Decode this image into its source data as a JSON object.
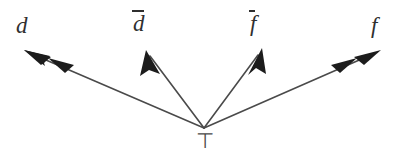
{
  "figure": {
    "type": "arrow-diagram",
    "background_color": "#ffffff",
    "line_color": "#4a4a4a",
    "arrowhead_color": "#1c1c1c",
    "label_color": "#2f2f2f"
  },
  "origin": {
    "label": "⊤",
    "label_name": "top-symbol",
    "x": 204,
    "y": 128
  },
  "arrows": [
    {
      "id": "arrow-d",
      "label": "d",
      "has_overline": false,
      "arrowheads": 2,
      "label_x": 16,
      "label_y": 14,
      "from_x": 204,
      "from_y": 128,
      "to_x": 24,
      "to_y": 50
    },
    {
      "id": "arrow-dbar",
      "label": "d",
      "has_overline": true,
      "arrowheads": 1,
      "label_x": 133,
      "label_y": 10,
      "from_x": 204,
      "from_y": 128,
      "to_x": 146,
      "to_y": 50
    },
    {
      "id": "arrow-fbar",
      "label": "f",
      "has_overline": true,
      "arrowheads": 1,
      "label_x": 250,
      "label_y": 10,
      "from_x": 204,
      "from_y": 128,
      "to_x": 262,
      "to_y": 48
    },
    {
      "id": "arrow-f",
      "label": "f",
      "has_overline": false,
      "arrowheads": 2,
      "label_x": 371,
      "label_y": 14,
      "from_x": 204,
      "from_y": 128,
      "to_x": 381,
      "to_y": 50
    }
  ]
}
